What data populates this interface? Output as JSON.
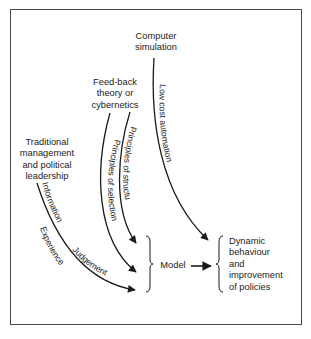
{
  "diagram": {
    "type": "flow",
    "sources": {
      "computer_simulation": "Computer simulation",
      "computer_simulation_lines": [
        "Computer",
        "simulation"
      ],
      "feedback_lines": [
        "Feed-back",
        "theory or",
        "cybernetics"
      ],
      "traditional_lines": [
        "Traditional",
        "management",
        "and political",
        "leadership"
      ]
    },
    "edges": {
      "low_cost_automation": "Low cost automation",
      "principles_of_structure": "Principles of structure",
      "principles_of_selection": "Principles of selection",
      "information": "Information",
      "experience": "Experience",
      "judgement": "Judgement"
    },
    "model": {
      "label": "Model"
    },
    "outcome": {
      "lines": [
        "Dynamic",
        "behaviour",
        "and",
        "improvement",
        "of policies"
      ]
    },
    "colors": {
      "line": "#1a1a1a",
      "frame": "#4a4a4a",
      "background": "#ffffff"
    }
  }
}
